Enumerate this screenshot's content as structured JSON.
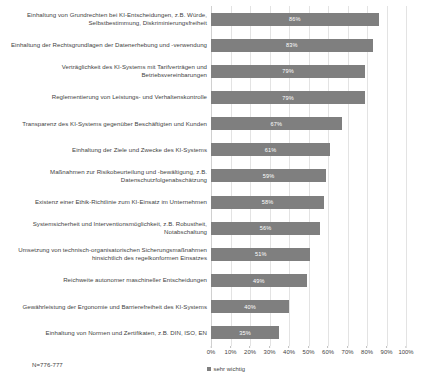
{
  "chart_data": {
    "type": "bar",
    "orientation": "horizontal",
    "title": "",
    "xlabel": "",
    "ylabel": "",
    "xlim": [
      0,
      100
    ],
    "grid": true,
    "legend_position": "bottom",
    "value_label_suffix": "%",
    "bar_color": "#7f7f7f",
    "gridline_color": "#e3e3e3",
    "categories": [
      "Einhaltung von Grundrechten bei KI-Entscheidungen, z.B. Würde, Selbstbestimmung, Diskriminierungsfreiheit",
      "Einhaltung der Rechtsgrundlagen der Datenerhebung und -verwendung",
      "Verträglichkeit des KI-Systems mit Tarifverträgen und Betriebsvereinbarungen",
      "Reglementierung von Leistungs- und Verhaltenskontrolle",
      "Transparenz des KI-Systems gegenüber Beschäftigten und Kunden",
      "Einhaltung der Ziele und Zwecke des KI-Systems",
      "Maßnahmen zur Risikobeurteilung und -bewältigung, z.B. Datenschutzfolgenabschätzung",
      "Existenz einer Ethik-Richtlinie zum KI-Einsatz im Unternehmen",
      "Systemsicherheit und Interventionsmöglichkeit, z.B. Robustheit, Notabschaltung",
      "Umsetzung von technisch-organisatorischen Sicherungsmaßnahmen hinsichtlich des regelkonformen Einsatzes",
      "Reichweite autonomer maschineller Entscheidungen",
      "Gewährleistung der Ergonomie und Barrierefreiheit des KI-Systems",
      "Einhaltung von Normen und Zertifikaten, z.B. DIN, ISO, EN"
    ],
    "values": [
      86,
      83,
      79,
      79,
      67,
      61,
      59,
      58,
      56,
      51,
      49,
      40,
      35
    ],
    "value_labels": [
      "86%",
      "83%",
      "79%",
      "79%",
      "67%",
      "61%",
      "59%",
      "58%",
      "56%",
      "51%",
      "49%",
      "40%",
      "35%"
    ],
    "series": [
      {
        "name": "sehr wichtig",
        "values": [
          86,
          83,
          79,
          79,
          67,
          61,
          59,
          58,
          56,
          51,
          49,
          40,
          35
        ]
      }
    ],
    "xticks": [
      0,
      10,
      20,
      30,
      40,
      50,
      60,
      70,
      80,
      90,
      100
    ],
    "xtick_labels": [
      "0%",
      "10%",
      "20%",
      "30%",
      "40%",
      "50%",
      "60%",
      "70%",
      "80%",
      "90%",
      "100%"
    ]
  },
  "legend": {
    "entries": [
      {
        "label": "sehr wichtig",
        "color": "#7f7f7f"
      }
    ]
  },
  "footnote": {
    "sample_size": "N=776-777"
  }
}
